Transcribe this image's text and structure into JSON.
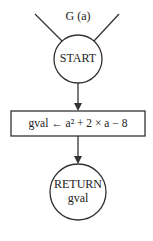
{
  "diagram": {
    "type": "flowchart",
    "function_label": "G (a)",
    "nodes": [
      {
        "id": "start",
        "shape": "circle",
        "label": "START"
      },
      {
        "id": "assign",
        "shape": "rectangle",
        "label": "gval ← a² + 2 × a − 8"
      },
      {
        "id": "return",
        "shape": "circle",
        "label_line1": "RETURN",
        "label_line2": "gval"
      }
    ],
    "edges": [
      {
        "from": "start",
        "to": "assign"
      },
      {
        "from": "assign",
        "to": "return"
      }
    ]
  }
}
